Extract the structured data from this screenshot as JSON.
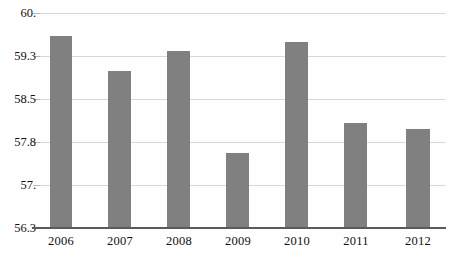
{
  "chart_data": {
    "type": "bar",
    "title": "",
    "subtitle": "",
    "xlabel": "",
    "ylabel": "",
    "categories": [
      "2006",
      "2007",
      "2008",
      "2009",
      "2010",
      "2011",
      "2012"
    ],
    "values": [
      59.6,
      59.0,
      59.35,
      57.6,
      59.5,
      58.1,
      58.0
    ],
    "series": [
      {
        "name": "value",
        "values": [
          59.6,
          59.0,
          59.35,
          57.6,
          59.5,
          58.1,
          58.0
        ]
      }
    ],
    "ylim": [
      56.3,
      60.0
    ],
    "ytick_labels": [
      "60.",
      "59.3",
      "58.5",
      "57.8",
      "57.",
      "56.3"
    ],
    "ytick_values": [
      60.0,
      59.3,
      58.5,
      57.8,
      57.0,
      56.3
    ],
    "grid": true,
    "legend": null,
    "legend_position": "none",
    "bar_color": "#808080",
    "gridline_color": "#d8d8d8",
    "axis_color": "#5a5a5a",
    "background_color": "#fefefe"
  },
  "axes": {
    "y": {
      "ticks": [
        {
          "label": "60.",
          "value": 60.0
        },
        {
          "label": "59.3",
          "value": 59.3
        },
        {
          "label": "58.5",
          "value": 58.5
        },
        {
          "label": "57.8",
          "value": 57.8
        },
        {
          "label": "57.",
          "value": 57.0
        },
        {
          "label": "56.3",
          "value": 56.3
        }
      ]
    },
    "x": {
      "ticks": [
        {
          "label": "2006"
        },
        {
          "label": "2007"
        },
        {
          "label": "2008"
        },
        {
          "label": "2009"
        },
        {
          "label": "2010"
        },
        {
          "label": "2011"
        },
        {
          "label": "2012"
        }
      ]
    }
  },
  "bars": [
    {
      "category": "2006",
      "value": 59.6
    },
    {
      "category": "2007",
      "value": 59.0
    },
    {
      "category": "2008",
      "value": 59.35
    },
    {
      "category": "2009",
      "value": 57.6
    },
    {
      "category": "2010",
      "value": 59.5
    },
    {
      "category": "2011",
      "value": 58.1
    },
    {
      "category": "2012",
      "value": 58.0
    }
  ]
}
